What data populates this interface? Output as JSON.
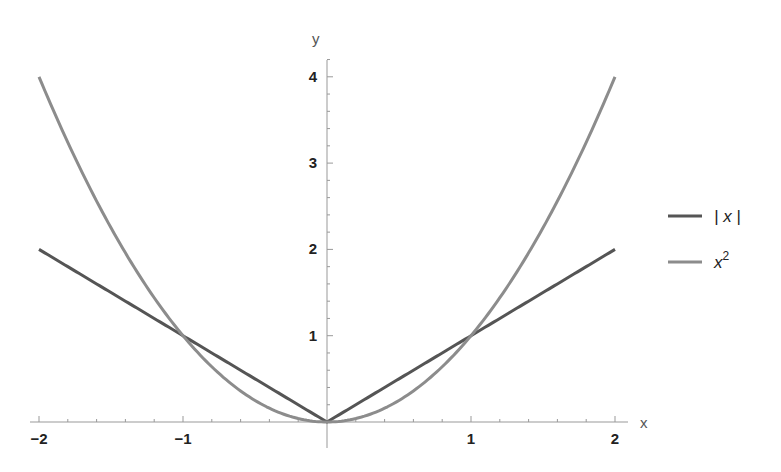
{
  "chart_data": {
    "type": "line",
    "title": "",
    "xlabel": "x",
    "ylabel": "y",
    "xlim": [
      -2,
      2
    ],
    "ylim": [
      0,
      4.2
    ],
    "x_ticks": [
      -2,
      -1,
      1,
      2
    ],
    "x_tick_labels": [
      "−2",
      "−1",
      "1",
      "2"
    ],
    "y_ticks": [
      1,
      2,
      3,
      4
    ],
    "y_tick_labels": [
      "1",
      "2",
      "3",
      "4"
    ],
    "grid": false,
    "legend_position": "right",
    "series": [
      {
        "name": "|x|",
        "legend_label": "| x |",
        "function": "abs",
        "color": "#555555",
        "x": [
          -2,
          -1,
          0,
          1,
          2
        ],
        "y": [
          2,
          1,
          0,
          1,
          2
        ]
      },
      {
        "name": "x^2",
        "legend_label": "x",
        "legend_superscript": "2",
        "function": "square",
        "color": "#8c8c8c",
        "x": [
          -2,
          -1.5,
          -1,
          -0.5,
          0,
          0.5,
          1,
          1.5,
          2
        ],
        "y": [
          4,
          2.25,
          1,
          0.25,
          0,
          0.25,
          1,
          2.25,
          4
        ]
      }
    ]
  }
}
